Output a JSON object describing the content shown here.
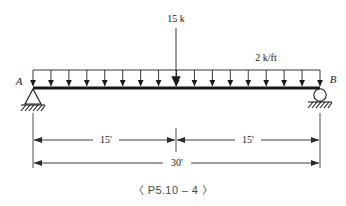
{
  "figure": {
    "caption": "〈 P5.10 – 4 〉",
    "type": "simply-supported-beam-loading-diagram"
  },
  "beam": {
    "left_support_label": "A",
    "right_support_label": "B",
    "left_support_type": "pin",
    "right_support_type": "roller",
    "span_px": {
      "x_left": 33,
      "x_right": 320,
      "y": 88
    }
  },
  "loads": {
    "point_load": {
      "label": "15 k",
      "magnitude": 15,
      "unit": "k",
      "position_ft": 15,
      "x_px": 176
    },
    "distributed_load": {
      "label": "2 k/ft",
      "magnitude": 2,
      "unit": "k/ft",
      "arrow_count": 17,
      "top_y_px": 70
    }
  },
  "dimensions": {
    "upper": [
      {
        "label": "15'",
        "value": 15,
        "unit": "ft",
        "x_start": 33,
        "x_end": 176
      },
      {
        "label": "15'",
        "value": 15,
        "unit": "ft",
        "x_start": 176,
        "x_end": 320
      }
    ],
    "lower": [
      {
        "label": "30'",
        "value": 30,
        "unit": "ft",
        "x_start": 33,
        "x_end": 320
      }
    ]
  },
  "colors": {
    "ink": "#1a1a1a",
    "line": "#2a2a2a",
    "caption": "#4a4a4a",
    "background": "#ffffff"
  }
}
